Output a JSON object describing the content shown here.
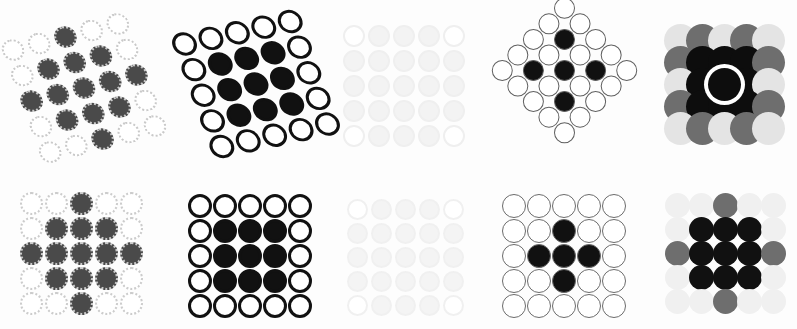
{
  "figure": {
    "title": "",
    "background_color": "#fdfdfd",
    "rows": 2,
    "columns": 5,
    "width": 797,
    "height": 329,
    "grid_rows": 5,
    "grid_cols": 5,
    "note": "Ten 5x5 circle-lattice panels; each cell is either an open (outlined) circle or a filled circle of varying gray level."
  },
  "palette": {
    "black": "#111111",
    "dark_gray": "#3d3d3d",
    "mid_gray": "#6e6e6e",
    "light_gray": "#e9e9e9",
    "very_light_gray": "#f2f2f2",
    "outline_dark": "#111111",
    "outline_mid": "#7a7a7a",
    "outline_light": "#d9d9d9",
    "outline_faint": "#efefef",
    "white": "#ffffff",
    "paper": "#fdfdfd"
  },
  "panels": [
    {
      "id": "panel-1",
      "position": "top-left",
      "index": 1,
      "label": "",
      "transform": "rotate(-14deg) skewX(6deg)",
      "x": 14,
      "y": 18,
      "w": 140,
      "h": 140,
      "cell": 27,
      "dot_size": 22,
      "outline_style": "dotted",
      "outline_color": "#c9c9c9",
      "outline_width": 2,
      "fill_color": "#4a4a4a",
      "empty_fill": "#ffffff",
      "pattern": [
        [
          0,
          0,
          1,
          0,
          0
        ],
        [
          0,
          1,
          1,
          1,
          0
        ],
        [
          1,
          1,
          1,
          1,
          1
        ],
        [
          0,
          1,
          1,
          1,
          0
        ],
        [
          0,
          0,
          1,
          0,
          0
        ]
      ]
    },
    {
      "id": "panel-2",
      "position": "top-2",
      "index": 2,
      "label": "",
      "transform": "rotate(-12deg) skewX(8deg)",
      "x": 186,
      "y": 14,
      "w": 140,
      "h": 140,
      "cell": 27,
      "dot_size": 24,
      "outline_style": "solid",
      "outline_color": "#111111",
      "outline_width": 3,
      "fill_color": "#111111",
      "empty_fill": "#ffffff",
      "pattern": [
        [
          0,
          0,
          0,
          0,
          0
        ],
        [
          0,
          1,
          1,
          1,
          0
        ],
        [
          0,
          1,
          1,
          1,
          0
        ],
        [
          0,
          1,
          1,
          1,
          0
        ],
        [
          0,
          0,
          0,
          0,
          0
        ]
      ]
    },
    {
      "id": "panel-3",
      "position": "top-3",
      "index": 3,
      "label": "",
      "transform": "none",
      "x": 340,
      "y": 22,
      "w": 128,
      "h": 128,
      "cell": 25,
      "dot_size": 22,
      "outline_style": "solid",
      "outline_color": "#efefef",
      "outline_width": 2,
      "fill_color": "#f3f3f3",
      "empty_fill": "#ffffff",
      "pattern": [
        [
          0,
          1,
          1,
          1,
          0
        ],
        [
          1,
          1,
          1,
          1,
          1
        ],
        [
          1,
          1,
          1,
          1,
          1
        ],
        [
          1,
          1,
          1,
          1,
          1
        ],
        [
          0,
          1,
          1,
          1,
          0
        ]
      ]
    },
    {
      "id": "panel-4",
      "position": "top-4",
      "index": 4,
      "label": "",
      "transform": "rotate(45deg)",
      "x": 508,
      "y": 14,
      "w": 113,
      "h": 113,
      "cell": 22,
      "dot_size": 21,
      "outline_style": "solid",
      "outline_color": "#5f5f5f",
      "outline_width": 1.5,
      "fill_color": "#111111",
      "empty_fill": "#ffffff",
      "pattern": [
        [
          0,
          0,
          0,
          0,
          0
        ],
        [
          0,
          1,
          0,
          1,
          0
        ],
        [
          0,
          0,
          1,
          0,
          0
        ],
        [
          0,
          1,
          0,
          1,
          0
        ],
        [
          0,
          0,
          0,
          0,
          0
        ]
      ]
    },
    {
      "id": "panel-5",
      "position": "top-right",
      "index": 5,
      "label": "",
      "transform": "none",
      "x": 672,
      "y": 24,
      "w": 104,
      "h": 120,
      "cell": 22,
      "dot_size": 33,
      "outline_style": "none",
      "outline_color": "#ffffff",
      "outline_width": 0,
      "fill_color": "#0d0d0d",
      "empty_fill": "#e4e4e4",
      "center_ring": true,
      "center_ring_color": "#ffffff",
      "pattern": [
        [
          0,
          2,
          0,
          2,
          0
        ],
        [
          2,
          1,
          1,
          1,
          2
        ],
        [
          0,
          1,
          3,
          1,
          0
        ],
        [
          2,
          1,
          1,
          1,
          2
        ],
        [
          0,
          2,
          0,
          2,
          0
        ]
      ],
      "level_legend": {
        "0": "very light gray",
        "1": "black",
        "2": "mid gray",
        "3": "black with white ring"
      }
    },
    {
      "id": "panel-6",
      "position": "bottom-left",
      "index": 6,
      "label": "",
      "transform": "none",
      "x": 18,
      "y": 190,
      "w": 126,
      "h": 126,
      "cell": 25,
      "dot_size": 23,
      "outline_style": "dotted",
      "outline_color": "#cccccc",
      "outline_width": 2,
      "fill_color": "#4a4a4a",
      "empty_fill": "#ffffff",
      "pattern": [
        [
          0,
          0,
          1,
          0,
          0
        ],
        [
          0,
          1,
          1,
          1,
          0
        ],
        [
          1,
          1,
          1,
          1,
          1
        ],
        [
          0,
          1,
          1,
          1,
          0
        ],
        [
          0,
          0,
          1,
          0,
          0
        ]
      ]
    },
    {
      "id": "panel-7",
      "position": "bottom-2",
      "index": 7,
      "label": "",
      "transform": "none",
      "x": 186,
      "y": 192,
      "w": 128,
      "h": 128,
      "cell": 25,
      "dot_size": 24,
      "outline_style": "solid",
      "outline_color": "#111111",
      "outline_width": 3,
      "fill_color": "#111111",
      "empty_fill": "#ffffff",
      "pattern": [
        [
          0,
          0,
          0,
          0,
          0
        ],
        [
          0,
          1,
          1,
          1,
          0
        ],
        [
          0,
          1,
          1,
          1,
          0
        ],
        [
          0,
          1,
          1,
          1,
          0
        ],
        [
          0,
          0,
          0,
          0,
          0
        ]
      ]
    },
    {
      "id": "panel-8",
      "position": "bottom-3",
      "index": 8,
      "label": "",
      "transform": "none",
      "x": 344,
      "y": 196,
      "w": 122,
      "h": 122,
      "cell": 24,
      "dot_size": 21,
      "outline_style": "solid",
      "outline_color": "#f0f0f0",
      "outline_width": 2,
      "fill_color": "#f4f4f4",
      "empty_fill": "#ffffff",
      "pattern": [
        [
          0,
          1,
          1,
          1,
          0
        ],
        [
          1,
          1,
          1,
          1,
          1
        ],
        [
          1,
          1,
          1,
          1,
          1
        ],
        [
          1,
          1,
          1,
          1,
          1
        ],
        [
          0,
          1,
          1,
          1,
          0
        ]
      ]
    },
    {
      "id": "panel-9",
      "position": "bottom-4",
      "index": 9,
      "label": "",
      "transform": "none",
      "x": 500,
      "y": 192,
      "w": 128,
      "h": 128,
      "cell": 25,
      "dot_size": 24,
      "outline_style": "solid",
      "outline_color": "#6b6b6b",
      "outline_width": 1.6,
      "fill_color": "#111111",
      "empty_fill": "#ffffff",
      "pattern": [
        [
          0,
          0,
          0,
          0,
          0
        ],
        [
          0,
          0,
          1,
          0,
          0
        ],
        [
          0,
          1,
          1,
          1,
          0
        ],
        [
          0,
          0,
          1,
          0,
          0
        ],
        [
          0,
          0,
          0,
          0,
          0
        ]
      ]
    },
    {
      "id": "panel-10",
      "position": "bottom-right",
      "index": 10,
      "label": "",
      "transform": "none",
      "x": 666,
      "y": 190,
      "w": 118,
      "h": 126,
      "cell": 24,
      "dot_size": 25,
      "outline_style": "none",
      "outline_color": "#ffffff",
      "outline_width": 0,
      "fill_color": "#111111",
      "empty_fill": "#f0f0f0",
      "pattern": [
        [
          0,
          0,
          2,
          0,
          0
        ],
        [
          0,
          1,
          1,
          1,
          0
        ],
        [
          2,
          1,
          1,
          1,
          2
        ],
        [
          0,
          1,
          1,
          1,
          0
        ],
        [
          0,
          0,
          2,
          0,
          0
        ]
      ],
      "level_legend": {
        "0": "very light gray",
        "1": "black",
        "2": "mid gray"
      }
    }
  ]
}
